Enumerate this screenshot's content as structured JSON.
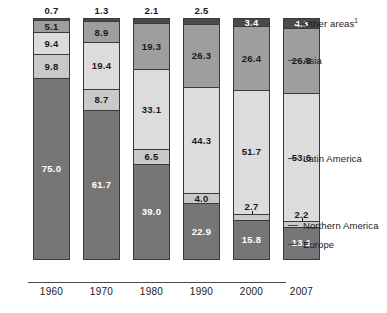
{
  "chart_data": {
    "type": "bar",
    "title": "",
    "subtitle": "",
    "xlabel": "",
    "ylabel": "",
    "stacked": true,
    "percent_stacked": true,
    "ylim": [
      0,
      100
    ],
    "grid": false,
    "legend_position": "right-callouts",
    "categories": [
      "1960",
      "1970",
      "1980",
      "1990",
      "2000",
      "2007"
    ],
    "series": [
      {
        "name": "Other areas",
        "values": [
          0.7,
          1.3,
          2.1,
          2.5,
          3.4,
          4.3
        ],
        "color": "#4a4a4a"
      },
      {
        "name": "Asia",
        "values": [
          5.1,
          8.9,
          19.3,
          26.3,
          26.4,
          26.8
        ],
        "color": "#9e9e9e"
      },
      {
        "name": "Latin America",
        "values": [
          9.4,
          19.4,
          33.1,
          44.3,
          51.7,
          53.6
        ],
        "color": "#dcdcdc"
      },
      {
        "name": "Northern America",
        "values": [
          9.8,
          8.7,
          6.5,
          4.0,
          2.7,
          2.2
        ],
        "color": "#c9c9c9"
      },
      {
        "name": "Europe",
        "values": [
          75.0,
          61.7,
          39.0,
          22.9,
          15.8,
          13.1
        ],
        "color": "#767676"
      }
    ],
    "annotations": [
      "Other areas value shown above the bar for 1960-1990 and inside the segment for 2000-2007"
    ]
  },
  "axis": {
    "ticks": [
      "1960",
      "1970",
      "1980",
      "1990",
      "2000",
      "2007"
    ]
  },
  "legend": {
    "items": [
      {
        "label": "Other areas",
        "footnote": "1"
      },
      {
        "label": "Asia",
        "footnote": ""
      },
      {
        "label": "Latin America",
        "footnote": ""
      },
      {
        "label": "Northern America",
        "footnote": ""
      },
      {
        "label": "Europe",
        "footnote": ""
      }
    ]
  },
  "bars": [
    {
      "year": "1960",
      "total_label": "0.7",
      "total_label_position": "above",
      "segments": [
        {
          "series": "Other areas",
          "value": 0.7,
          "label": "",
          "label_tone": "dark"
        },
        {
          "series": "Asia",
          "value": 5.1,
          "label": "5.1",
          "label_tone": "dark"
        },
        {
          "series": "Latin America",
          "value": 9.4,
          "label": "9.4",
          "label_tone": "dark"
        },
        {
          "series": "Northern America",
          "value": 9.8,
          "label": "9.8",
          "label_tone": "dark"
        },
        {
          "series": "Europe",
          "value": 75.0,
          "label": "75.0",
          "label_tone": "light"
        }
      ]
    },
    {
      "year": "1970",
      "total_label": "1.3",
      "total_label_position": "above",
      "segments": [
        {
          "series": "Other areas",
          "value": 1.3,
          "label": "",
          "label_tone": "dark"
        },
        {
          "series": "Asia",
          "value": 8.9,
          "label": "8.9",
          "label_tone": "dark"
        },
        {
          "series": "Latin America",
          "value": 19.4,
          "label": "19.4",
          "label_tone": "dark"
        },
        {
          "series": "Northern America",
          "value": 8.7,
          "label": "8.7",
          "label_tone": "dark"
        },
        {
          "series": "Europe",
          "value": 61.7,
          "label": "61.7",
          "label_tone": "light"
        }
      ]
    },
    {
      "year": "1980",
      "total_label": "2.1",
      "total_label_position": "above",
      "segments": [
        {
          "series": "Other areas",
          "value": 2.1,
          "label": "",
          "label_tone": "dark"
        },
        {
          "series": "Asia",
          "value": 19.3,
          "label": "19.3",
          "label_tone": "dark"
        },
        {
          "series": "Latin America",
          "value": 33.1,
          "label": "33.1",
          "label_tone": "dark"
        },
        {
          "series": "Northern America",
          "value": 6.5,
          "label": "6.5",
          "label_tone": "dark"
        },
        {
          "series": "Europe",
          "value": 39.0,
          "label": "39.0",
          "label_tone": "light"
        }
      ]
    },
    {
      "year": "1990",
      "total_label": "2.5",
      "total_label_position": "above",
      "segments": [
        {
          "series": "Other areas",
          "value": 2.5,
          "label": "",
          "label_tone": "dark"
        },
        {
          "series": "Asia",
          "value": 26.3,
          "label": "26.3",
          "label_tone": "dark"
        },
        {
          "series": "Latin America",
          "value": 44.3,
          "label": "44.3",
          "label_tone": "dark"
        },
        {
          "series": "Northern America",
          "value": 4.0,
          "label": "4.0",
          "label_tone": "dark"
        },
        {
          "series": "Europe",
          "value": 22.9,
          "label": "22.9",
          "label_tone": "light"
        }
      ]
    },
    {
      "year": "2000",
      "total_label": "",
      "total_label_position": "inside",
      "segments": [
        {
          "series": "Other areas",
          "value": 3.4,
          "label": "3.4",
          "label_tone": "light"
        },
        {
          "series": "Asia",
          "value": 26.4,
          "label": "26.4",
          "label_tone": "dark"
        },
        {
          "series": "Latin America",
          "value": 51.7,
          "label": "51.7",
          "label_tone": "dark"
        },
        {
          "series": "Northern America",
          "value": 2.7,
          "label": "2.7",
          "label_tone": "dark",
          "label_above": true
        },
        {
          "series": "Europe",
          "value": 15.8,
          "label": "15.8",
          "label_tone": "light"
        }
      ]
    },
    {
      "year": "2007",
      "total_label": "",
      "total_label_position": "inside",
      "segments": [
        {
          "series": "Other areas",
          "value": 4.3,
          "label": "4.3",
          "label_tone": "light"
        },
        {
          "series": "Asia",
          "value": 26.8,
          "label": "26.8",
          "label_tone": "dark"
        },
        {
          "series": "Latin America",
          "value": 53.6,
          "label": "53.6",
          "label_tone": "dark"
        },
        {
          "series": "Northern America",
          "value": 2.2,
          "label": "2.2",
          "label_tone": "dark",
          "label_above": true
        },
        {
          "series": "Europe",
          "value": 13.1,
          "label": "13.1",
          "label_tone": "light"
        }
      ]
    }
  ]
}
